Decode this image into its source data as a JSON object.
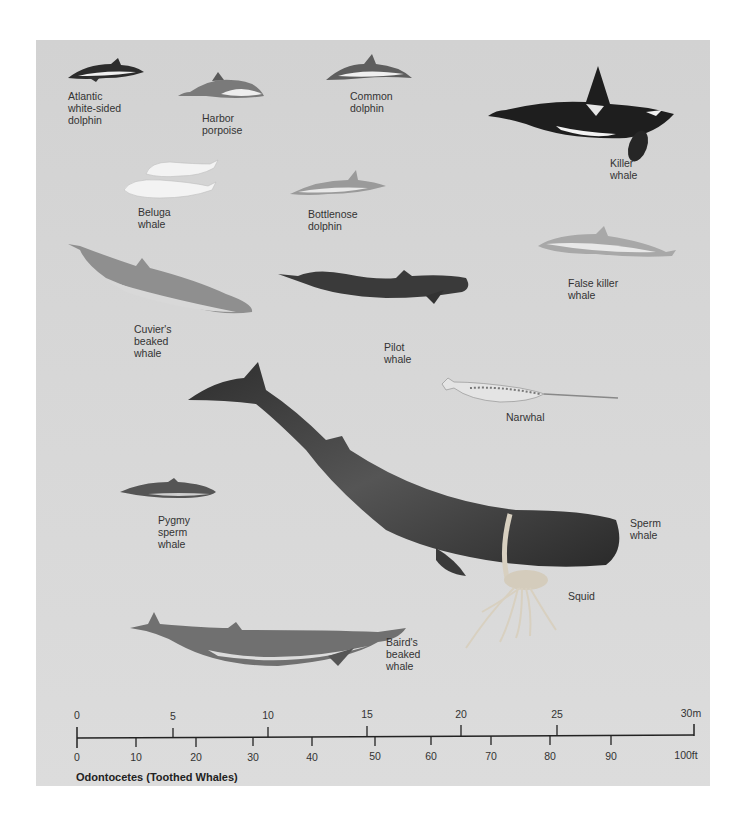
{
  "title": "Odontocetes (Toothed Whales)",
  "colors": {
    "background": "#d6d6d6",
    "text": "#333333",
    "dark": "#2a2a2a",
    "light": "#f2f2f2"
  },
  "animals": [
    {
      "id": "atlantic-white-sided-dolphin",
      "label": "Atlantic\nwhite-sided\ndolphin"
    },
    {
      "id": "harbor-porpoise",
      "label": "Harbor\nporpoise"
    },
    {
      "id": "common-dolphin",
      "label": "Common\ndolphin"
    },
    {
      "id": "killer-whale",
      "label": "Killer\nwhale"
    },
    {
      "id": "beluga-whale",
      "label": "Beluga\nwhale"
    },
    {
      "id": "bottlenose-dolphin",
      "label": "Bottlenose\ndolphin"
    },
    {
      "id": "cuviers-beaked-whale",
      "label": "Cuvier's\nbeaked\nwhale"
    },
    {
      "id": "pilot-whale",
      "label": "Pilot\nwhale"
    },
    {
      "id": "false-killer-whale",
      "label": "False killer\nwhale"
    },
    {
      "id": "narwhal",
      "label": "Narwhal"
    },
    {
      "id": "pygmy-sperm-whale",
      "label": "Pygmy\nsperm\nwhale"
    },
    {
      "id": "sperm-whale",
      "label": "Sperm\nwhale"
    },
    {
      "id": "squid",
      "label": "Squid"
    },
    {
      "id": "bairds-beaked-whale",
      "label": "Baird's\nbeaked\nwhale"
    }
  ],
  "scale": {
    "meters": [
      "0",
      "5",
      "10",
      "15",
      "20",
      "25",
      "30m"
    ],
    "feet": [
      "0",
      "10",
      "20",
      "30",
      "40",
      "50",
      "60",
      "70",
      "80",
      "90",
      "100ft"
    ]
  }
}
